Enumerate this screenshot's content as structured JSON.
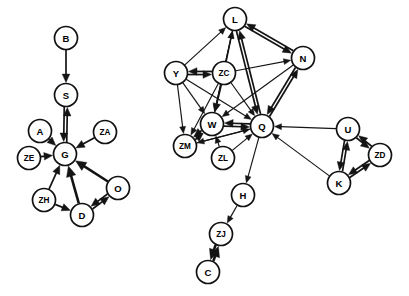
{
  "diagram": {
    "type": "node-link-graph",
    "background_color": "#ffffff",
    "node_fill": "#ffffff",
    "node_stroke": "#111111",
    "edge_color": "#141414",
    "width": 409,
    "height": 296,
    "node_radius": 11.5
  },
  "nodes": [
    {
      "id": "B",
      "label": "B",
      "x": 66,
      "y": 38,
      "cluster": "left"
    },
    {
      "id": "S",
      "label": "S",
      "x": 66,
      "y": 95,
      "cluster": "left"
    },
    {
      "id": "A",
      "label": "A",
      "x": 40,
      "y": 131,
      "cluster": "left"
    },
    {
      "id": "ZA",
      "label": "ZA",
      "x": 105,
      "y": 132,
      "cluster": "left"
    },
    {
      "id": "ZE",
      "label": "ZE",
      "x": 29,
      "y": 158,
      "cluster": "left"
    },
    {
      "id": "G",
      "label": "G",
      "x": 65,
      "y": 154,
      "cluster": "left"
    },
    {
      "id": "ZH",
      "label": "ZH",
      "x": 44,
      "y": 200,
      "cluster": "left"
    },
    {
      "id": "O",
      "label": "O",
      "x": 118,
      "y": 188,
      "cluster": "left"
    },
    {
      "id": "D",
      "label": "D",
      "x": 82,
      "y": 215,
      "cluster": "left"
    },
    {
      "id": "L",
      "label": "L",
      "x": 235,
      "y": 19,
      "cluster": "right"
    },
    {
      "id": "N",
      "label": "N",
      "x": 303,
      "y": 58,
      "cluster": "right"
    },
    {
      "id": "Y",
      "label": "Y",
      "x": 176,
      "y": 73,
      "cluster": "right"
    },
    {
      "id": "ZC",
      "label": "ZC",
      "x": 224,
      "y": 73,
      "cluster": "right"
    },
    {
      "id": "W",
      "label": "W",
      "x": 212,
      "y": 124,
      "cluster": "right"
    },
    {
      "id": "Q",
      "label": "Q",
      "x": 262,
      "y": 126,
      "cluster": "right"
    },
    {
      "id": "ZM",
      "label": "ZM",
      "x": 185,
      "y": 146,
      "cluster": "right"
    },
    {
      "id": "ZL",
      "label": "ZL",
      "x": 223,
      "y": 158,
      "cluster": "right"
    },
    {
      "id": "U",
      "label": "U",
      "x": 348,
      "y": 129,
      "cluster": "right"
    },
    {
      "id": "ZD",
      "label": "ZD",
      "x": 380,
      "y": 155,
      "cluster": "right"
    },
    {
      "id": "K",
      "label": "K",
      "x": 339,
      "y": 183,
      "cluster": "right"
    },
    {
      "id": "H",
      "label": "H",
      "x": 243,
      "y": 195,
      "cluster": "right"
    },
    {
      "id": "ZJ",
      "label": "ZJ",
      "x": 221,
      "y": 234,
      "cluster": "right"
    },
    {
      "id": "C",
      "label": "C",
      "x": 208,
      "y": 272,
      "cluster": "right"
    }
  ],
  "edges": [
    {
      "from": "B",
      "to": "S",
      "bidirectional": false,
      "weight": "med"
    },
    {
      "from": "S",
      "to": "G",
      "bidirectional": true,
      "weight": "med"
    },
    {
      "from": "A",
      "to": "G",
      "bidirectional": false,
      "weight": "med"
    },
    {
      "from": "ZA",
      "to": "G",
      "bidirectional": false,
      "weight": "med"
    },
    {
      "from": "ZE",
      "to": "G",
      "bidirectional": false,
      "weight": "med"
    },
    {
      "from": "ZH",
      "to": "G",
      "bidirectional": false,
      "weight": "med"
    },
    {
      "from": "D",
      "to": "G",
      "bidirectional": false,
      "weight": "thick"
    },
    {
      "from": "O",
      "to": "G",
      "bidirectional": false,
      "weight": "thick"
    },
    {
      "from": "ZH",
      "to": "D",
      "bidirectional": false,
      "weight": "med"
    },
    {
      "from": "O",
      "to": "D",
      "bidirectional": true,
      "weight": "med"
    },
    {
      "from": "Y",
      "to": "L",
      "bidirectional": false,
      "weight": "thin"
    },
    {
      "from": "Y",
      "to": "ZC",
      "bidirectional": true,
      "weight": "med"
    },
    {
      "from": "Y",
      "to": "W",
      "bidirectional": false,
      "weight": "thin"
    },
    {
      "from": "Y",
      "to": "ZM",
      "bidirectional": false,
      "weight": "thin"
    },
    {
      "from": "Y",
      "to": "Q",
      "bidirectional": false,
      "weight": "thin"
    },
    {
      "from": "ZC",
      "to": "L",
      "bidirectional": false,
      "weight": "thin"
    },
    {
      "from": "ZC",
      "to": "N",
      "bidirectional": false,
      "weight": "thin"
    },
    {
      "from": "ZC",
      "to": "W",
      "bidirectional": false,
      "weight": "med"
    },
    {
      "from": "ZC",
      "to": "ZM",
      "bidirectional": false,
      "weight": "thin"
    },
    {
      "from": "ZC",
      "to": "Q",
      "bidirectional": false,
      "weight": "thin"
    },
    {
      "from": "L",
      "to": "N",
      "bidirectional": true,
      "weight": "med"
    },
    {
      "from": "L",
      "to": "Q",
      "bidirectional": true,
      "weight": "med"
    },
    {
      "from": "L",
      "to": "W",
      "bidirectional": false,
      "weight": "thin"
    },
    {
      "from": "N",
      "to": "Q",
      "bidirectional": true,
      "weight": "med"
    },
    {
      "from": "N",
      "to": "W",
      "bidirectional": false,
      "weight": "thin"
    },
    {
      "from": "W",
      "to": "Q",
      "bidirectional": true,
      "weight": "med"
    },
    {
      "from": "W",
      "to": "ZM",
      "bidirectional": true,
      "weight": "med"
    },
    {
      "from": "W",
      "to": "L",
      "bidirectional": false,
      "weight": "thin"
    },
    {
      "from": "ZL",
      "to": "W",
      "bidirectional": false,
      "weight": "thin"
    },
    {
      "from": "ZL",
      "to": "Q",
      "bidirectional": false,
      "weight": "thin"
    },
    {
      "from": "ZM",
      "to": "Q",
      "bidirectional": false,
      "weight": "thin"
    },
    {
      "from": "Q",
      "to": "ZM",
      "bidirectional": false,
      "weight": "thin"
    },
    {
      "from": "U",
      "to": "Q",
      "bidirectional": false,
      "weight": "thin"
    },
    {
      "from": "K",
      "to": "Q",
      "bidirectional": false,
      "weight": "thin"
    },
    {
      "from": "U",
      "to": "K",
      "bidirectional": true,
      "weight": "med"
    },
    {
      "from": "ZD",
      "to": "U",
      "bidirectional": true,
      "weight": "med"
    },
    {
      "from": "ZD",
      "to": "K",
      "bidirectional": true,
      "weight": "med"
    },
    {
      "from": "Q",
      "to": "H",
      "bidirectional": false,
      "weight": "thin"
    },
    {
      "from": "H",
      "to": "ZJ",
      "bidirectional": false,
      "weight": "thin"
    },
    {
      "from": "C",
      "to": "ZJ",
      "bidirectional": true,
      "weight": "thick"
    }
  ]
}
